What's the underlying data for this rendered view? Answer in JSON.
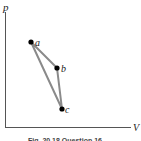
{
  "diagram": {
    "type": "pV-diagram",
    "axes": {
      "y_label": "p",
      "x_label": "V"
    },
    "points": [
      {
        "id": "a",
        "label": "a",
        "x": 31,
        "y": 42
      },
      {
        "id": "b",
        "label": "b",
        "x": 57,
        "y": 68
      },
      {
        "id": "c",
        "label": "c",
        "x": 62,
        "y": 109
      }
    ],
    "path": [
      "a",
      "b",
      "c",
      "a"
    ],
    "colors": {
      "axis": "#555555",
      "path": "#8a8a8a",
      "point": "#000000"
    },
    "caption": "Fig. 20.18 Question 16"
  }
}
